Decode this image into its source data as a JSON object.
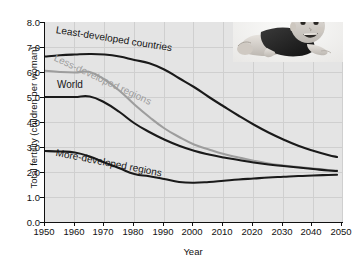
{
  "chart_data": {
    "type": "line",
    "title": "",
    "xlabel": "Year",
    "ylabel": "Total fertility (children per woman)",
    "xlim": [
      1950,
      2050
    ],
    "ylim": [
      0.0,
      8.0
    ],
    "grid": true,
    "legend": "inline-annotations",
    "xticks": [
      1950,
      1960,
      1970,
      1980,
      1990,
      2000,
      2010,
      2020,
      2030,
      2040,
      2050
    ],
    "yticks": [
      "0.0",
      "1.0",
      "2.0",
      "3.0",
      "4.0",
      "5.0",
      "6.0",
      "7.0",
      "8.0"
    ],
    "x": [
      1950,
      1955,
      1960,
      1965,
      1970,
      1975,
      1980,
      1985,
      1990,
      1995,
      2000,
      2005,
      2010,
      2015,
      2020,
      2025,
      2030,
      2035,
      2040,
      2045,
      2048
    ],
    "series": [
      {
        "name": "Least-developed countries",
        "color": "#1a1a1a",
        "values": [
          6.62,
          6.67,
          6.7,
          6.72,
          6.7,
          6.62,
          6.48,
          6.35,
          6.1,
          5.75,
          5.4,
          5.0,
          4.62,
          4.25,
          3.9,
          3.58,
          3.3,
          3.05,
          2.85,
          2.68,
          2.6
        ]
      },
      {
        "name": "Less-developed regions",
        "color": "#9d9d9d",
        "values": [
          6.05,
          6.0,
          5.98,
          6.0,
          5.7,
          5.25,
          4.7,
          4.2,
          3.75,
          3.4,
          3.1,
          2.9,
          2.72,
          2.58,
          2.45,
          2.34,
          2.26,
          2.2,
          2.14,
          2.08,
          2.06
        ]
      },
      {
        "name": "World",
        "color": "#1a1a1a",
        "values": [
          5.0,
          5.0,
          5.0,
          5.02,
          4.78,
          4.4,
          3.95,
          3.6,
          3.3,
          3.05,
          2.85,
          2.7,
          2.58,
          2.48,
          2.38,
          2.3,
          2.24,
          2.18,
          2.12,
          2.06,
          2.04
        ]
      },
      {
        "name": "More-developed regions",
        "color": "#1a1a1a",
        "values": [
          2.84,
          2.82,
          2.78,
          2.62,
          2.38,
          2.15,
          1.92,
          1.83,
          1.72,
          1.6,
          1.57,
          1.6,
          1.65,
          1.7,
          1.74,
          1.78,
          1.81,
          1.84,
          1.86,
          1.88,
          1.89
        ]
      }
    ],
    "annotations": [
      {
        "text": "Least-developed countries",
        "color": "#141414"
      },
      {
        "text": "Less-developed regions",
        "color": "#9d9d9d"
      },
      {
        "text": "World",
        "color": "#141414"
      },
      {
        "text": "More-developed regions",
        "color": "#141414"
      }
    ],
    "image": {
      "name": "baby-photo",
      "description": "black and white photograph of a smiling baby lying on stomach"
    }
  }
}
